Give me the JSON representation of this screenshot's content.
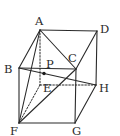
{
  "diagram": {
    "type": "geometry",
    "vertices": [
      "A",
      "B",
      "C",
      "D",
      "E",
      "F",
      "G",
      "H"
    ],
    "points": [
      "P"
    ],
    "labels": {
      "A": "A",
      "B": "B",
      "C": "C",
      "D": "D",
      "E": "E",
      "F": "F",
      "G": "G",
      "H": "H",
      "P": "P"
    },
    "visible_edges": [
      [
        "A",
        "D"
      ],
      [
        "A",
        "B"
      ],
      [
        "B",
        "C"
      ],
      [
        "C",
        "D"
      ],
      [
        "D",
        "H"
      ],
      [
        "B",
        "F"
      ],
      [
        "C",
        "G"
      ],
      [
        "F",
        "G"
      ],
      [
        "G",
        "H"
      ],
      [
        "A",
        "C"
      ],
      [
        "A",
        "F"
      ],
      [
        "F",
        "C"
      ],
      [
        "B",
        "H"
      ]
    ],
    "hidden_edges": [
      [
        "A",
        "E"
      ],
      [
        "E",
        "H"
      ],
      [
        "E",
        "F"
      ]
    ],
    "marked_point": {
      "name": "P",
      "on_segment": [
        "B",
        "H"
      ]
    }
  }
}
